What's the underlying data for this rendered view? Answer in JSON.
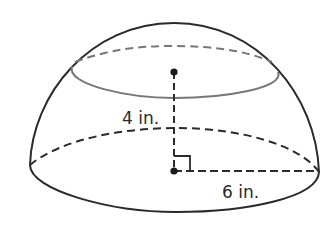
{
  "figure": {
    "type": "hemisphere",
    "height_label": "4 in.",
    "radius_label": "6 in.",
    "line_color": "#2a2a2a",
    "inner_ellipse_color": "#777777",
    "background": "#ffffff"
  }
}
